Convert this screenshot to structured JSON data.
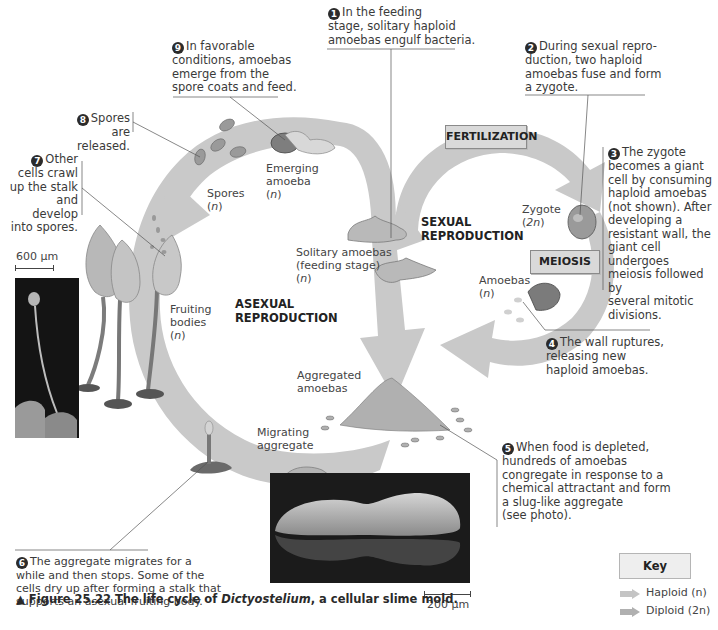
{
  "figure": {
    "caption_prefix": "▲ Figure 25.22",
    "caption_text_before": "The life cycle of",
    "caption_italic": "Dictyostelium",
    "caption_text_after": ", a cellular slime mold."
  },
  "cycles": {
    "sexual_label_line1": "SEXUAL",
    "sexual_label_line2": "REPRODUCTION",
    "asexual_label_line1": "ASEXUAL",
    "asexual_label_line2": "REPRODUCTION",
    "fertilization": "FERTILIZATION",
    "meiosis": "MEIOSIS"
  },
  "stage_labels": {
    "spores": "Spores",
    "spores_ploidy": "n",
    "emerging": "Emerging",
    "emerging2": "amoeba",
    "emerging_ploidy": "n",
    "solitary1": "Solitary amoebas",
    "solitary2": "(feeding stage)",
    "solitary_ploidy": "n",
    "zygote": "Zygote",
    "zygote_ploidy": "2n",
    "amoebas": "Amoebas",
    "amoebas_ploidy": "n",
    "fruiting1": "Fruiting",
    "fruiting2": "bodies",
    "fruiting_ploidy": "n",
    "aggregated1": "Aggregated",
    "aggregated2": "amoebas",
    "migrating1": "Migrating",
    "migrating2": "aggregate"
  },
  "notes": [
    {
      "num": "1",
      "lines": [
        "In the feeding",
        "stage, solitary haploid",
        "amoebas engulf bacteria."
      ]
    },
    {
      "num": "2",
      "lines": [
        "During sexual repro-",
        "duction, two haploid",
        "amoebas fuse and form",
        "a zygote."
      ]
    },
    {
      "num": "3",
      "lines": [
        "The zygote",
        "becomes a giant",
        "cell by consuming",
        "haploid amoebas",
        "(not shown). After",
        "developing a",
        "resistant wall, the",
        "giant cell undergoes",
        "meiosis followed by",
        "several mitotic",
        "divisions."
      ]
    },
    {
      "num": "4",
      "lines": [
        "The wall ruptures,",
        "releasing new",
        "haploid amoebas."
      ]
    },
    {
      "num": "5",
      "lines": [
        "When food is depleted,",
        "hundreds of amoebas",
        "congregate in response to a",
        "chemical attractant and form",
        "a slug-like aggregate",
        "(see photo)."
      ]
    },
    {
      "num": "6",
      "lines": [
        "The aggregate migrates for a",
        "while and then stops. Some of the",
        "cells dry up after forming a stalk that",
        "supports an asexual fruiting body."
      ]
    },
    {
      "num": "7",
      "lines": [
        "Other",
        "cells crawl",
        "up the stalk",
        "and develop",
        "into spores."
      ]
    },
    {
      "num": "8",
      "lines": [
        "Spores",
        "are released."
      ]
    },
    {
      "num": "9",
      "lines": [
        "In favorable",
        "conditions, amoebas",
        "emerge from the",
        "spore coats and feed."
      ]
    }
  ],
  "scale_bars": {
    "fruiting_photo": "600 µm",
    "slug_photo": "200 µm"
  },
  "key": {
    "title": "Key",
    "haploid": "Haploid (n)",
    "diploid": "Diploid (2n)",
    "haploid_color": "#c4c4c4",
    "diploid_color": "#b0b0b0"
  },
  "colors": {
    "arrow_fill": "#c9c9c9",
    "background": "#ffffff"
  }
}
